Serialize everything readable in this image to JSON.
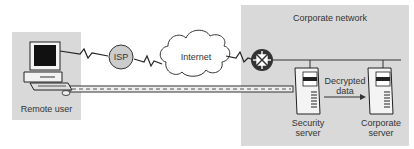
{
  "diagram": {
    "remote_user": {
      "label": "Remote user",
      "icon": "desktop-computer-icon"
    },
    "isp": {
      "label": "ISP"
    },
    "internet": {
      "label": "Internet"
    },
    "corporate_network": {
      "label": "Corporate network"
    },
    "router": {
      "icon": "router-icon"
    },
    "security_server": {
      "label_line1": "Security",
      "label_line2": "server"
    },
    "corporate_server": {
      "label_line1": "Corporate",
      "label_line2": "server"
    },
    "flow": {
      "label_line1": "Decrypted",
      "label_line2": "data"
    },
    "colors": {
      "panel": "#d9d9d9",
      "line": "#333333",
      "isp_fill": "#cccccc",
      "router_fill": "#333333"
    }
  }
}
